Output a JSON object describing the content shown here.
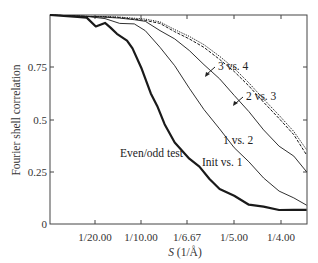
{
  "chart_data": {
    "type": "line",
    "title": "",
    "xlabel": "S (1/Å)",
    "xlabel_italic_part": "S",
    "xlabel_unit": "(1/Å)",
    "ylabel": "Fourier shell correlation",
    "xlim": [
      0.0,
      0.2804
    ],
    "ylim": [
      0,
      1.0
    ],
    "grid": false,
    "legend": "inline annotations",
    "x_ticks": [
      {
        "value": 0.05,
        "label": "1/20.00"
      },
      {
        "value": 0.1,
        "label": "1/10.00"
      },
      {
        "value": 0.15,
        "label": "1/6.67"
      },
      {
        "value": 0.2,
        "label": "1/5.00"
      },
      {
        "value": 0.25,
        "label": "1/4.00"
      }
    ],
    "y_ticks": [
      {
        "value": 0,
        "label": "0"
      },
      {
        "value": 0.25,
        "label": "0.25"
      },
      {
        "value": 0.5,
        "label": "0.5"
      },
      {
        "value": 0.75,
        "label": "0.75"
      }
    ],
    "series": [
      {
        "name": "3 vs. 4",
        "style": "dotted",
        "width": 1,
        "x": [
          0.0,
          0.04,
          0.06,
          0.076,
          0.104,
          0.12,
          0.136,
          0.152,
          0.168,
          0.185,
          0.201,
          0.217,
          0.233,
          0.25,
          0.266,
          0.28
        ],
        "y": [
          1.0,
          0.998,
          0.995,
          0.99,
          0.978,
          0.962,
          0.935,
          0.9,
          0.858,
          0.8,
          0.74,
          0.68,
          0.6,
          0.52,
          0.44,
          0.355
        ]
      },
      {
        "name": "2 vs. 3",
        "style": "dashed",
        "width": 1,
        "x": [
          0.0,
          0.04,
          0.06,
          0.076,
          0.104,
          0.12,
          0.136,
          0.152,
          0.168,
          0.185,
          0.201,
          0.217,
          0.233,
          0.25,
          0.266,
          0.28
        ],
        "y": [
          1.0,
          0.998,
          0.994,
          0.988,
          0.972,
          0.955,
          0.925,
          0.888,
          0.845,
          0.785,
          0.725,
          0.665,
          0.585,
          0.505,
          0.425,
          0.33
        ]
      },
      {
        "name": "1 vs. 2",
        "style": "solid-thin",
        "width": 0.9,
        "x": [
          0.0,
          0.04,
          0.06,
          0.076,
          0.092,
          0.104,
          0.12,
          0.136,
          0.152,
          0.168,
          0.185,
          0.201,
          0.217,
          0.233,
          0.25,
          0.266,
          0.28
        ],
        "y": [
          1.0,
          0.998,
          0.992,
          0.985,
          0.975,
          0.965,
          0.93,
          0.888,
          0.83,
          0.76,
          0.69,
          0.62,
          0.54,
          0.45,
          0.37,
          0.32,
          0.25
        ]
      },
      {
        "name": "Init vs. 1",
        "style": "solid-thin",
        "width": 0.9,
        "x": [
          0.0,
          0.04,
          0.06,
          0.076,
          0.092,
          0.104,
          0.12,
          0.136,
          0.152,
          0.168,
          0.185,
          0.201,
          0.217,
          0.233,
          0.25,
          0.266,
          0.28
        ],
        "y": [
          1.0,
          0.998,
          0.985,
          0.96,
          0.955,
          0.92,
          0.85,
          0.76,
          0.65,
          0.545,
          0.45,
          0.37,
          0.3,
          0.22,
          0.155,
          0.12,
          0.09
        ]
      },
      {
        "name": "Even/odd test",
        "style": "solid-thick",
        "width": 2.2,
        "x": [
          0.0,
          0.03,
          0.04,
          0.05,
          0.06,
          0.066,
          0.073,
          0.084,
          0.09,
          0.1,
          0.11,
          0.117,
          0.125,
          0.136,
          0.152,
          0.163,
          0.174,
          0.185,
          0.201,
          0.217,
          0.233,
          0.25,
          0.266,
          0.28
        ],
        "y": [
          1.0,
          0.995,
          0.99,
          0.945,
          0.96,
          0.935,
          0.915,
          0.88,
          0.84,
          0.74,
          0.62,
          0.57,
          0.48,
          0.39,
          0.31,
          0.27,
          0.22,
          0.17,
          0.135,
          0.09,
          0.078,
          0.072,
          0.07,
          0.068
        ]
      }
    ],
    "annotations": [
      {
        "text": "3 vs. 4",
        "target_series": "3 vs. 4",
        "arrow": true
      },
      {
        "text": "2 vs. 3",
        "target_series": "2 vs. 3",
        "arrow": true
      },
      {
        "text": "1 vs. 2",
        "target_series": "1 vs. 2",
        "arrow": false
      },
      {
        "text": "Init vs. 1",
        "target_series": "Init vs. 1",
        "arrow": false
      },
      {
        "text": "Even/odd test",
        "target_series": "Even/odd test",
        "arrow": false
      }
    ]
  },
  "labels": {
    "ylabel": "Fourier shell correlation",
    "xlabel_var": "S",
    "xlabel_unit": " (1/Å)",
    "annot_3v4": "3 vs. 4",
    "annot_2v3": "2 vs. 3",
    "annot_1v2": "1 vs. 2",
    "annot_init": "Init vs. 1",
    "annot_evenodd": "Even/odd test",
    "xtick_0": "1/20.00",
    "xtick_1": "1/10.00",
    "xtick_2": "1/6.67",
    "xtick_3": "1/5.00",
    "xtick_4": "1/4.00",
    "ytick_0": "0",
    "ytick_1": "0.25",
    "ytick_2": "0.5",
    "ytick_3": "0.75"
  }
}
